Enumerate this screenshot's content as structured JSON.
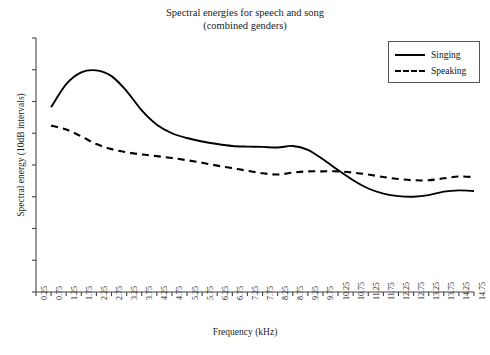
{
  "chart_data": {
    "type": "line",
    "title": "Spectral energies for speech and song (combined genders)",
    "title_lines": [
      "Spectral energies for speech and song",
      "(combined genders)"
    ],
    "xlabel": "Frequency (kHz)",
    "ylabel": "Spectral energy (10dB intervals)",
    "grid": false,
    "legend_position": "top-right",
    "xlim": [
      0.25,
      14.75
    ],
    "ylim": [
      0,
      8
    ],
    "y_tick_count": 9,
    "y_tick_labels": [],
    "x": [
      0.25,
      0.75,
      1.25,
      1.75,
      2.25,
      2.75,
      3.25,
      3.75,
      4.25,
      4.75,
      5.25,
      5.75,
      6.25,
      6.75,
      7.25,
      7.75,
      8.25,
      8.75,
      9.25,
      9.75,
      10.25,
      10.75,
      11.25,
      11.75,
      12.25,
      12.75,
      13.25,
      13.75,
      14.25,
      14.75
    ],
    "categories": [
      "0.25",
      "0.75",
      "1.25",
      "1.75",
      "2.25",
      "2.75",
      "3.25",
      "3.75",
      "4.25",
      "4.75",
      "5.25",
      "5.75",
      "6.25",
      "6.75",
      "7.25",
      "7.75",
      "8.25",
      "8.75",
      "9.25",
      "9.75",
      "10.25",
      "10.75",
      "11.25",
      "11.75",
      "12.25",
      "12.75",
      "13.25",
      "13.75",
      "14.25",
      "14.75"
    ],
    "series": [
      {
        "name": "Singing",
        "style": "solid",
        "color": "#000000",
        "values": [
          null,
          5.82,
          6.55,
          6.92,
          6.98,
          6.8,
          6.33,
          5.72,
          5.27,
          5.0,
          4.85,
          4.74,
          4.66,
          4.6,
          4.58,
          4.57,
          4.55,
          4.6,
          4.48,
          4.18,
          3.84,
          3.52,
          3.26,
          3.1,
          3.02,
          3.0,
          3.05,
          3.16,
          3.2,
          3.18
        ]
      },
      {
        "name": "Speaking",
        "style": "dashed",
        "color": "#000000",
        "values": [
          null,
          5.24,
          5.12,
          4.9,
          4.66,
          4.5,
          4.4,
          4.33,
          4.28,
          4.22,
          4.15,
          4.07,
          3.98,
          3.9,
          3.82,
          3.74,
          3.7,
          3.76,
          3.8,
          3.8,
          3.8,
          3.76,
          3.7,
          3.62,
          3.56,
          3.52,
          3.52,
          3.58,
          3.64,
          3.62
        ]
      }
    ],
    "legend": [
      {
        "label": "Singing",
        "style": "solid"
      },
      {
        "label": "Speaking",
        "style": "dashed"
      }
    ]
  }
}
